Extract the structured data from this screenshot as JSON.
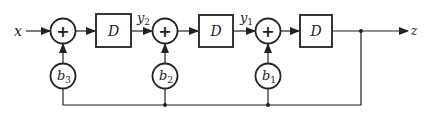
{
  "diagram": {
    "type": "signal-flow block diagram",
    "input_label": "x",
    "output_label": "z",
    "adders": [
      {
        "id": "adder-1",
        "symbol": "+",
        "coeff_label": "b",
        "coeff_sub": "3"
      },
      {
        "id": "adder-2",
        "symbol": "+",
        "coeff_label": "b",
        "coeff_sub": "2"
      },
      {
        "id": "adder-3",
        "symbol": "+",
        "coeff_label": "b",
        "coeff_sub": "1"
      }
    ],
    "delays": [
      {
        "id": "delay-1",
        "label": "D",
        "output_label": "y",
        "output_sub": "2"
      },
      {
        "id": "delay-2",
        "label": "D",
        "output_label": "y",
        "output_sub": "1"
      },
      {
        "id": "delay-3",
        "label": "D"
      }
    ],
    "colors": {
      "stroke": "#222222",
      "background": "#ffffff"
    }
  }
}
